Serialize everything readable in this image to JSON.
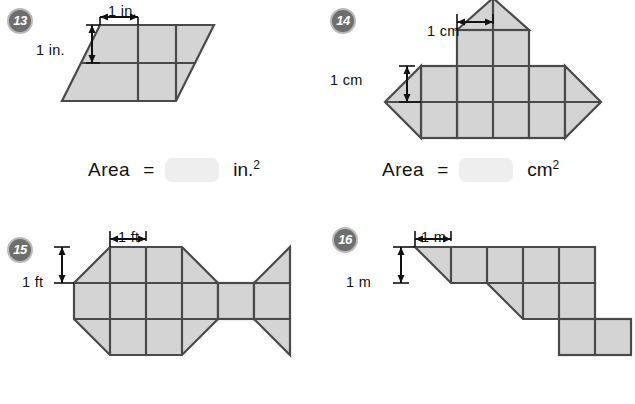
{
  "worksheet": {
    "page_background": "#ffffff",
    "shape_fill": "#d4d4d4",
    "shape_stroke": "#4a4a4a",
    "badge_fill": "#6e6e6e",
    "badge_ring": "#b9b9b9",
    "answer_box_fill": "#eeeeee"
  },
  "problems": [
    {
      "number": "13",
      "unit_width_label": "1 in.",
      "unit_height_label": "1 in.",
      "answer": {
        "label": "Area",
        "equals": "=",
        "value": "",
        "unit": "in.",
        "exponent": "2"
      }
    },
    {
      "number": "14",
      "unit_width_label": "1 cm",
      "unit_height_label": "1 cm",
      "answer": {
        "label": "Area",
        "equals": "=",
        "value": "",
        "unit": "cm",
        "exponent": "2"
      }
    },
    {
      "number": "15",
      "unit_width_label": "1 ft",
      "unit_height_label": "1 ft"
    },
    {
      "number": "16",
      "unit_width_label": "1 m",
      "unit_height_label": "1 m"
    }
  ]
}
